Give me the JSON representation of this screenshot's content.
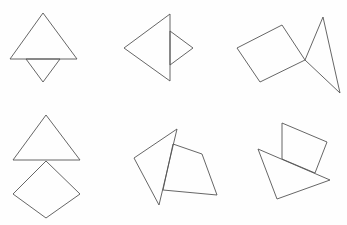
{
  "figure": {
    "width": 347,
    "height": 225,
    "stroke_color": "#555555",
    "background": "#fefefe",
    "panels": [
      {
        "name": "panel-1",
        "shapes": [
          {
            "type": "triangle",
            "points": "43,13 10,59 77,59"
          },
          {
            "type": "triangle",
            "points": "26,59 60,59 43,82"
          }
        ]
      },
      {
        "name": "panel-2",
        "shapes": [
          {
            "type": "triangle",
            "points": "170,14 124,48 170,81"
          },
          {
            "type": "triangle",
            "points": "170,31 193,48 170,65"
          }
        ]
      },
      {
        "name": "panel-3",
        "shapes": [
          {
            "type": "quadrilateral",
            "points": "237,48 282,25 305,60 260,82"
          },
          {
            "type": "triangle",
            "points": "305,60 323,17 340,93"
          }
        ]
      },
      {
        "name": "panel-4",
        "shapes": [
          {
            "type": "triangle",
            "points": "46,115 13,160 80,160"
          },
          {
            "type": "quadrilateral",
            "points": "46,161 13,194 46,218 80,194"
          }
        ]
      },
      {
        "name": "panel-5",
        "shapes": [
          {
            "type": "triangle",
            "points": "177,129 134,158 159,205"
          },
          {
            "type": "quadrilateral",
            "points": "173,144 202,154 217,195 163,190"
          }
        ]
      },
      {
        "name": "panel-6",
        "shapes": [
          {
            "type": "quadrilateral",
            "points": "282,123 327,142 315,173 282,159"
          },
          {
            "type": "triangle",
            "points": "258,149 330,180 277,199"
          }
        ]
      }
    ]
  }
}
